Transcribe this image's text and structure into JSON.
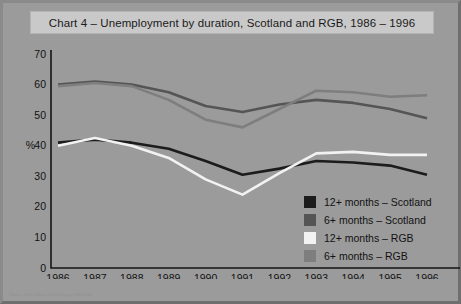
{
  "title": "Chart 4 – Unemployment by duration, Scotland and RGB, 1986 – 1996",
  "footnote": "Source: ONS Labour Force Survey, 1986-1996",
  "axis": {
    "y_label": "%",
    "y_ticks": [
      "0",
      "10",
      "20",
      "30",
      "40",
      "50",
      "60",
      "70"
    ],
    "x_ticks": [
      "1986",
      "1987",
      "1988",
      "1989",
      "1990",
      "1991",
      "1992",
      "1993",
      "1994",
      "1995",
      "1996"
    ]
  },
  "legend": {
    "items": [
      {
        "label": "12+ months – Scotland",
        "color": "#1c1c1c"
      },
      {
        "label": "6+ months – Scotland",
        "color": "#555555"
      },
      {
        "label": "12+ months – RGB",
        "color": "#f2f2f2"
      },
      {
        "label": "6+ months – RGB",
        "color": "#7e7e7e"
      }
    ]
  },
  "chart_data": {
    "type": "line",
    "title": "Chart 4 – Unemployment by duration, Scotland and RGB, 1986 – 1996",
    "xlabel": "",
    "ylabel": "%",
    "ylim": [
      0,
      70
    ],
    "ytick_step": 10,
    "grid": false,
    "legend_position": "inside-bottom-right",
    "categories": [
      "1986",
      "1987",
      "1988",
      "1989",
      "1990",
      "1991",
      "1992",
      "1993",
      "1994",
      "1995",
      "1996"
    ],
    "series": [
      {
        "name": "6+ months – Scotland",
        "color": "#555555",
        "values": [
          60,
          61,
          60,
          57.5,
          53,
          51,
          53.5,
          55,
          54,
          52,
          49
        ]
      },
      {
        "name": "6+ months – RGB",
        "color": "#7e7e7e",
        "values": [
          59.5,
          60.5,
          59.5,
          55,
          48.5,
          46,
          52,
          58,
          57.5,
          56,
          56.5
        ]
      },
      {
        "name": "12+ months – Scotland",
        "color": "#1c1c1c",
        "values": [
          41,
          42,
          41,
          39,
          35,
          30.5,
          32.5,
          35,
          34.5,
          33.5,
          30.5
        ]
      },
      {
        "name": "12+ months – RGB",
        "color": "#f2f2f2",
        "values": [
          40,
          42.5,
          40,
          36,
          29,
          24,
          31,
          37.5,
          38,
          37,
          37
        ]
      }
    ]
  }
}
